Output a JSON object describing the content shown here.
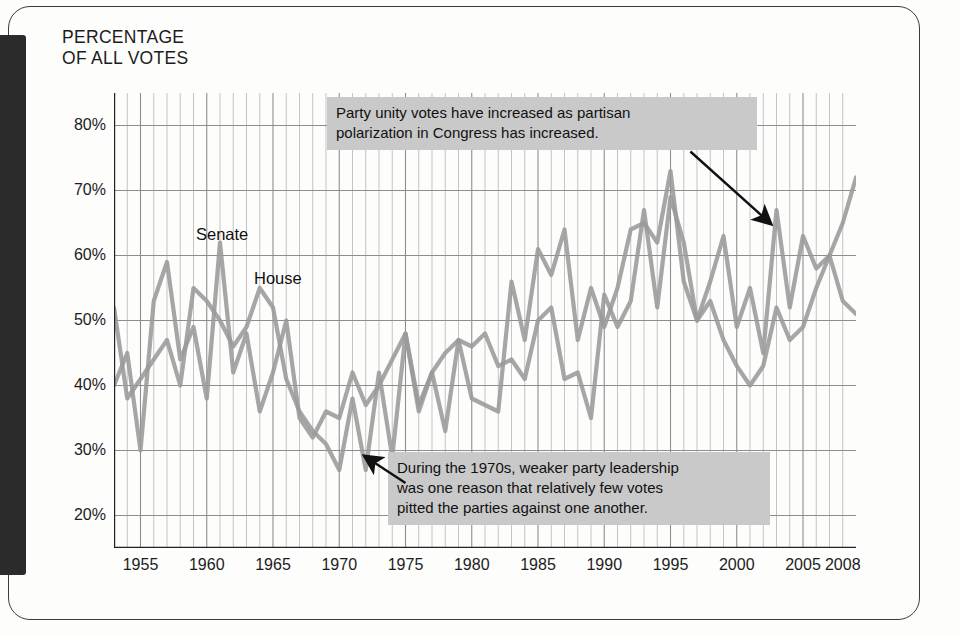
{
  "page": {
    "axis_title": "PERCENTAGE\nOF ALL VOTES"
  },
  "callouts": {
    "top": "Party unity votes have increased as partisan\npolarization in Congress has increased.",
    "bottom": "During the 1970s, weaker party leadership\nwas one reason that relatively few votes\npitted the parties against one another."
  },
  "series_labels": {
    "senate": "Senate",
    "house": "House"
  },
  "colors": {
    "line": "#9a9a9a",
    "grid_minor": "#b9b9b9",
    "grid_major": "#8e8e8e",
    "axis": "#222222",
    "callout_bg": "#c9c9c9",
    "binding": "#2b2b2b"
  },
  "chart_data": {
    "type": "line",
    "title": "",
    "subtitle": "",
    "xlabel": "",
    "ylabel": "PERCENTAGE OF ALL VOTES",
    "xlim": [
      1953,
      2009
    ],
    "ylim": [
      15,
      85
    ],
    "ytick_values": [
      20,
      30,
      40,
      50,
      60,
      70,
      80
    ],
    "ytick_labels": [
      "20%",
      "30%",
      "40%",
      "50%",
      "60%",
      "70%",
      "80%"
    ],
    "xtick_values": [
      1955,
      1960,
      1965,
      1970,
      1975,
      1980,
      1985,
      1990,
      1995,
      2000,
      2005,
      2008
    ],
    "xtick_labels": [
      "1955",
      "1960",
      "1965",
      "1970",
      "1975",
      "1980",
      "1985",
      "1990",
      "1995",
      "2000",
      "2005",
      "2008"
    ],
    "grid": "both-minor-yearly",
    "legend": "inline-labels",
    "x": [
      1953,
      1954,
      1955,
      1956,
      1957,
      1958,
      1959,
      1960,
      1961,
      1962,
      1963,
      1964,
      1965,
      1966,
      1967,
      1968,
      1969,
      1970,
      1971,
      1972,
      1973,
      1974,
      1975,
      1976,
      1977,
      1978,
      1979,
      1980,
      1981,
      1982,
      1983,
      1984,
      1985,
      1986,
      1987,
      1988,
      1989,
      1990,
      1991,
      1992,
      1993,
      1994,
      1995,
      1996,
      1997,
      1998,
      1999,
      2000,
      2001,
      2002,
      2003,
      2004,
      2005,
      2006,
      2007,
      2008,
      2009
    ],
    "series": [
      {
        "name": "Senate",
        "color": "#9a9a9a",
        "values": [
          40,
          45,
          30,
          53,
          59,
          44,
          49,
          38,
          62,
          42,
          48,
          36,
          42,
          50,
          35,
          32,
          36,
          35,
          42,
          37,
          40,
          44,
          48,
          37,
          42,
          45,
          47,
          46,
          48,
          43,
          44,
          41,
          50,
          52,
          41,
          42,
          35,
          54,
          49,
          53,
          67,
          52,
          69,
          62,
          50,
          56,
          63,
          49,
          55,
          45,
          67,
          52,
          63,
          58,
          60,
          65,
          72
        ]
      },
      {
        "name": "House",
        "color": "#9a9a9a",
        "values": [
          52,
          38,
          41,
          44,
          47,
          40,
          55,
          53,
          50,
          46,
          49,
          55,
          52,
          41,
          36,
          33,
          31,
          27,
          38,
          27,
          42,
          29,
          48,
          36,
          42,
          33,
          47,
          38,
          37,
          36,
          56,
          47,
          61,
          57,
          64,
          47,
          55,
          49,
          55,
          64,
          65,
          62,
          73,
          56,
          50,
          53,
          47,
          43,
          40,
          43,
          52,
          47,
          49,
          55,
          60,
          53,
          51
        ]
      }
    ],
    "annotations": [
      {
        "text": "Party unity votes have increased as partisan polarization in Congress has increased.",
        "arrow_from_year": 1996.5,
        "arrow_from_value": 76,
        "arrow_to_year": 2002.5,
        "arrow_to_value": 65
      },
      {
        "text": "During the 1970s, weaker party leadership was one reason that relatively few votes pitted the parties against one another.",
        "arrow_from_year": 1975.0,
        "arrow_from_value": 25,
        "arrow_to_year": 1972.0,
        "arrow_to_value": 29
      }
    ]
  }
}
